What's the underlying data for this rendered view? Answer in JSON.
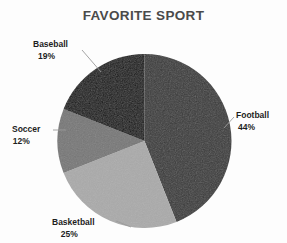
{
  "chart_data": {
    "type": "pie",
    "title": "FAVORITE SPORT",
    "xlabel": "",
    "ylabel": "",
    "legend_position": "none",
    "labels_position": "outside-with-leader-lines",
    "start_angle_deg": 0,
    "direction": "clockwise",
    "categories": [
      "Football",
      "Basketball",
      "Soccer",
      "Baseball"
    ],
    "values": [
      44,
      25,
      12,
      19
    ],
    "value_unit": "percent",
    "total": 100,
    "slices": [
      {
        "label": "Football",
        "percent": 44,
        "percent_text": "44%",
        "color": "#3a3a3a",
        "start_deg": 0,
        "end_deg": 158.4
      },
      {
        "label": "Basketball",
        "percent": 25,
        "percent_text": "25%",
        "color": "#aaaaaa",
        "start_deg": 158.4,
        "end_deg": 248.4
      },
      {
        "label": "Soccer",
        "percent": 12,
        "percent_text": "12%",
        "color": "#777777",
        "start_deg": 248.4,
        "end_deg": 291.6
      },
      {
        "label": "Baseball",
        "percent": 19,
        "percent_text": "19%",
        "color": "#141414",
        "start_deg": 291.6,
        "end_deg": 360
      }
    ]
  },
  "colors": {
    "background": "#fdfdfd",
    "title": "#4a4a4a",
    "label_text": "#1e1e1e",
    "leader_line": "#9a9a9a",
    "football": "#3a3a3a",
    "basketball": "#aaaaaa",
    "soccer": "#777777",
    "baseball": "#141414"
  }
}
